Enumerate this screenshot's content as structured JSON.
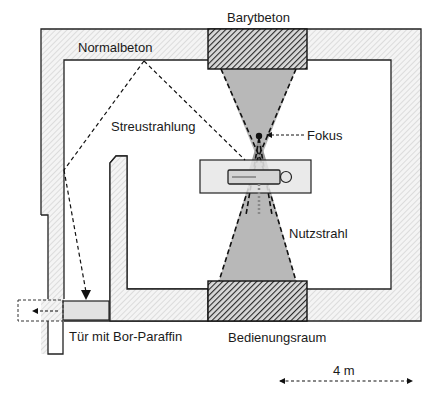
{
  "diagram": {
    "labels": {
      "normalbeton": "Normalbeton",
      "barytbeton": "Barytbeton",
      "streustrahlung": "Streustrahlung",
      "fokus": "Fokus",
      "nutzstrahl": "Nutzstrahl",
      "tuer": "Tür mit Bor-Paraffin",
      "bedienungsraum": "Bedienungsraum",
      "scale": "4 m"
    },
    "colors": {
      "wall_fill": "#f2f2f2",
      "wall_hatch": "#c8c8c8",
      "baryt_fill": "#3a3a3a",
      "beam_fill": "#b4b4b4",
      "door_fill": "#e0e0e0",
      "table_fill": "#e6e6e6",
      "line": "#222222"
    }
  }
}
